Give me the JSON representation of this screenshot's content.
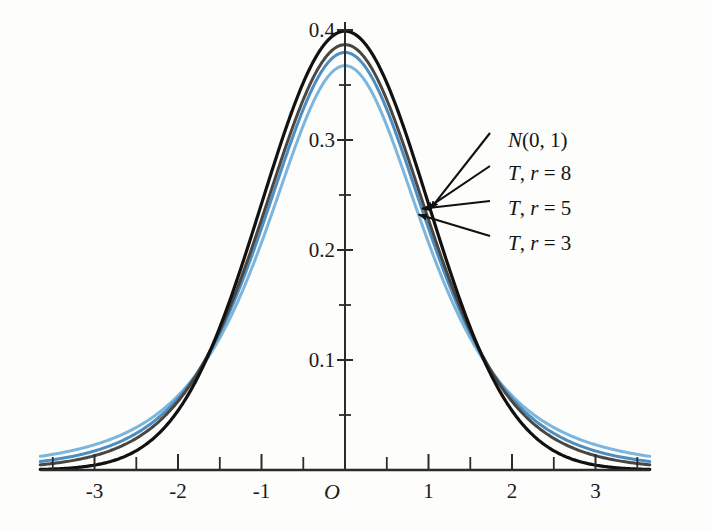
{
  "figure": {
    "background_color": "#fdfdfb",
    "axis_color": "#2b2b2b"
  },
  "chart_data": {
    "type": "line",
    "title": "",
    "subtitle": "",
    "xlabel": "",
    "ylabel": "",
    "xlim": [
      -3.65,
      3.65
    ],
    "ylim": [
      0,
      0.443
    ],
    "grid": false,
    "legend_position": "inline-annotations-right",
    "x_ticks_major": [
      -3,
      -2,
      -1,
      0,
      1,
      2,
      3
    ],
    "x_tick_labels": [
      "-3",
      "-2",
      "-1",
      "O",
      "1",
      "2",
      "3"
    ],
    "x_ticks_minor": [
      -3.5,
      -2.5,
      -1.5,
      -0.5,
      0.5,
      1.5,
      2.5,
      3.5
    ],
    "y_ticks_major": [
      0.1,
      0.2,
      0.3,
      0.4
    ],
    "y_tick_labels": [
      "0.1",
      "0.2",
      "0.3",
      "0.4"
    ],
    "y_ticks_minor": [
      0.05,
      0.15,
      0.25,
      0.35
    ],
    "origin_tick_label": "O",
    "series": [
      {
        "name": "N(0, 1)",
        "label_plain": "N(0, 1)",
        "label_italic_prefix": "N",
        "label_rest": "(0, 1)",
        "distribution": "normal",
        "df": null,
        "color": "#111111",
        "width": 3.2,
        "peak_value": 0.399,
        "peak_x": 0,
        "values_at": {
          "0": 0.399,
          "0.5": 0.352,
          "1": 0.242,
          "1.5": 0.13,
          "2": 0.054,
          "2.5": 0.018,
          "3": 0.004,
          "3.5": 0.001
        }
      },
      {
        "name": "T, r = 8",
        "label_italic_prefix": "T",
        "label_rest": ", r = 8",
        "distribution": "student-t",
        "df": 8,
        "color": "#4a4742",
        "width": 3.0,
        "peak_value": 0.387,
        "peak_x": 0,
        "values_at": {
          "0": 0.387,
          "0.5": 0.343,
          "1": 0.238,
          "1.5": 0.133,
          "2": 0.061,
          "2.5": 0.025,
          "3": 0.01,
          "3.5": 0.004
        }
      },
      {
        "name": "T, r = 5",
        "label_italic_prefix": "T",
        "label_rest": ", r = 5",
        "distribution": "student-t",
        "df": 5,
        "color": "#4e8dc0",
        "width": 3.0,
        "peak_value": 0.38,
        "peak_x": 0,
        "values_at": {
          "0": 0.38,
          "0.5": 0.337,
          "1": 0.23,
          "1.5": 0.133,
          "2": 0.065,
          "2.5": 0.03,
          "3": 0.014,
          "3.5": 0.007
        }
      },
      {
        "name": "T, r = 3",
        "label_italic_prefix": "T",
        "label_rest": ", r = 3",
        "distribution": "student-t",
        "df": 3,
        "color": "#7cb6dd",
        "width": 3.0,
        "peak_value": 0.367,
        "peak_x": 0,
        "values_at": {
          "0": 0.367,
          "0.5": 0.328,
          "1": 0.23,
          "1.5": 0.136,
          "2": 0.072,
          "2.5": 0.038,
          "3": 0.02,
          "3.5": 0.012
        }
      }
    ],
    "annotations": [
      {
        "text": "N(0, 1)",
        "target_series": "N(0, 1)",
        "arrow_to_x": 1.02,
        "arrow_to_y": 0.3
      },
      {
        "text": "T, r = 8",
        "target_series": "T, r = 8",
        "arrow_to_x": 0.96,
        "arrow_to_y": 0.265
      },
      {
        "text": "T, r = 5",
        "target_series": "T, r = 5",
        "arrow_to_x": 0.92,
        "arrow_to_y": 0.228
      },
      {
        "text": "T, r = 3",
        "target_series": "T, r = 3",
        "arrow_to_x": 0.88,
        "arrow_to_y": 0.19
      }
    ]
  },
  "labels": {
    "x": [
      "-3",
      "-2",
      "-1",
      "O",
      "1",
      "2",
      "3"
    ],
    "y": [
      "0.1",
      "0.2",
      "0.3",
      "0.4"
    ],
    "series": [
      {
        "prefix": "N",
        "rest": "(0, 1)"
      },
      {
        "prefix": "T",
        "rest": ", r = 8"
      },
      {
        "prefix": "T",
        "rest": ", r = 5"
      },
      {
        "prefix": "T",
        "rest": ", r = 3"
      }
    ]
  }
}
